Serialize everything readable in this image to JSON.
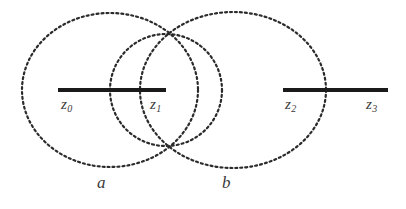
{
  "figure": {
    "background_color": "#ffffff",
    "stroke_color": "#2b2b2b",
    "label_color": "#3a3a3a",
    "width": 406,
    "height": 209
  },
  "chart_data": {
    "type": "diagram",
    "title": "",
    "xlabel": "",
    "ylabel": "",
    "xlim": [
      0,
      406
    ],
    "ylim": [
      0,
      209
    ],
    "grid": false,
    "legend": "none",
    "contours": [
      {
        "name": "contour-a",
        "label": "a",
        "shape": "circle",
        "cx": 110,
        "cy": 90,
        "rx": 88,
        "ry": 77,
        "style": "dashed",
        "stroke": "#2b2b2b",
        "stroke_width": 2.2,
        "dash": "2 3"
      },
      {
        "name": "contour-middle",
        "label": "",
        "shape": "circle",
        "cx": 166,
        "cy": 90,
        "rx": 56,
        "ry": 56,
        "style": "dashed",
        "stroke": "#2b2b2b",
        "stroke_width": 2.2,
        "dash": "2 3"
      },
      {
        "name": "contour-b",
        "label": "b",
        "shape": "ellipse",
        "cx": 233,
        "cy": 90,
        "rx": 93,
        "ry": 78,
        "style": "dashed",
        "stroke": "#2b2b2b",
        "stroke_width": 2.2,
        "dash": "2 3"
      }
    ],
    "branch_cuts": [
      {
        "name": "branch-cut-left",
        "x1": 58,
        "x2": 166,
        "y": 90,
        "stroke": "#1a1a1a",
        "stroke_width": 4,
        "endpoints": [
          "z0",
          "z1"
        ]
      },
      {
        "name": "branch-cut-right",
        "x1": 283,
        "x2": 388,
        "y": 90,
        "stroke": "#1a1a1a",
        "stroke_width": 4,
        "endpoints": [
          "z2",
          "z3"
        ]
      }
    ],
    "point_labels": [
      {
        "id": "z0",
        "base": "z",
        "sub": "0",
        "x": 61,
        "y": 97
      },
      {
        "id": "z1",
        "base": "z",
        "sub": "1",
        "x": 150,
        "y": 97
      },
      {
        "id": "z2",
        "base": "z",
        "sub": "2",
        "x": 285,
        "y": 97
      },
      {
        "id": "z3",
        "base": "z",
        "sub": "3",
        "x": 366,
        "y": 97
      }
    ],
    "region_labels": [
      {
        "id": "a",
        "text": "a",
        "x": 97,
        "y": 174
      },
      {
        "id": "b",
        "text": "b",
        "x": 222,
        "y": 174
      }
    ]
  },
  "labels": {
    "z0": {
      "base": "z",
      "sub": "0"
    },
    "z1": {
      "base": "z",
      "sub": "1"
    },
    "z2": {
      "base": "z",
      "sub": "2"
    },
    "z3": {
      "base": "z",
      "sub": "3"
    },
    "region_a": "a",
    "region_b": "b"
  }
}
